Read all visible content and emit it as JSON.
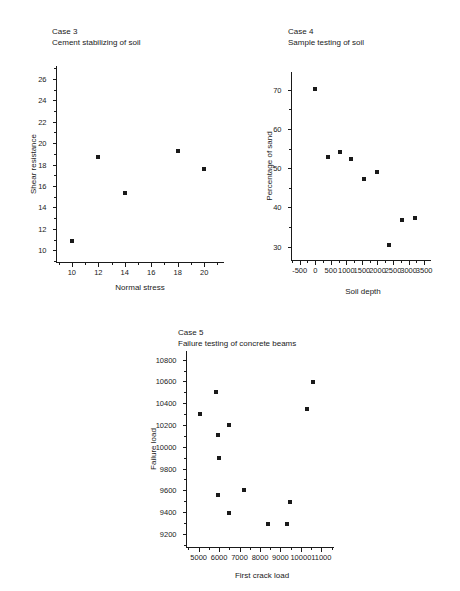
{
  "figure": {
    "background": "#ffffff",
    "marker_color": "#1a1a1a",
    "axis_color": "#1a1a1a"
  },
  "charts": [
    {
      "id": "case-3",
      "type": "scatter",
      "title_line1": "Case 3",
      "title_line2": "Cement stabilizing of soil",
      "title": "Case 3 — Cement stabilizing of soil",
      "xlabel": "Normal stress",
      "ylabel": "Shear resistance",
      "xticks": [
        10,
        12,
        14,
        16,
        18,
        20
      ],
      "yticks": [
        10,
        12,
        14,
        16,
        18,
        20,
        22,
        24,
        26
      ],
      "xlim": [
        8.8,
        21.5
      ],
      "ylim": [
        8.9,
        27.2
      ],
      "grid": false,
      "legend": "none",
      "points": [
        {
          "x": 10,
          "y": 10.9
        },
        {
          "x": 12,
          "y": 18.7
        },
        {
          "x": 14,
          "y": 15.35
        },
        {
          "x": 18,
          "y": 19.25
        },
        {
          "x": 20,
          "y": 17.55
        }
      ]
    },
    {
      "id": "case-4",
      "type": "scatter",
      "title_line1": "Case 4",
      "title_line2": "Sample testing of soil",
      "title": "Case 4 — Sample testing of soil",
      "xlabel": "Soil depth",
      "ylabel": "Percentage of sand",
      "xticks": [
        -500,
        0,
        500,
        1000,
        1500,
        2000,
        2500,
        3000,
        3500
      ],
      "yticks": [
        30,
        40,
        50,
        60,
        70
      ],
      "xlim": [
        -780,
        3720
      ],
      "ylim": [
        26.6,
        74.5
      ],
      "grid": false,
      "legend": "none",
      "points": [
        {
          "x": 0,
          "y": 70.2
        },
        {
          "x": 400,
          "y": 52.9
        },
        {
          "x": 780,
          "y": 54.2
        },
        {
          "x": 1150,
          "y": 52.3
        },
        {
          "x": 1580,
          "y": 47.3
        },
        {
          "x": 2000,
          "y": 49.1
        },
        {
          "x": 2380,
          "y": 30.4
        },
        {
          "x": 2790,
          "y": 36.8
        },
        {
          "x": 3200,
          "y": 37.3
        }
      ]
    },
    {
      "id": "case-5",
      "type": "scatter",
      "title_line1": "Case 5",
      "title_line2": "Failure testing of concrete beams",
      "title": "Case 5 — Failure testing of concrete beams",
      "xlabel": "First crack load",
      "ylabel": "Failure load",
      "xticks": [
        5000,
        6000,
        7000,
        8000,
        9000,
        10000,
        11000
      ],
      "yticks": [
        9200,
        9400,
        9600,
        9800,
        10000,
        10200,
        10400,
        10600,
        10800
      ],
      "xlim": [
        4380,
        11620
      ],
      "ylim": [
        9080,
        10880
      ],
      "grid": false,
      "legend": "none",
      "points": [
        {
          "x": 5080,
          "y": 10300
        },
        {
          "x": 5850,
          "y": 10505
        },
        {
          "x": 5960,
          "y": 10105
        },
        {
          "x": 5980,
          "y": 9895
        },
        {
          "x": 5960,
          "y": 9560
        },
        {
          "x": 6500,
          "y": 10205
        },
        {
          "x": 6500,
          "y": 9395
        },
        {
          "x": 7200,
          "y": 9600
        },
        {
          "x": 8400,
          "y": 9295
        },
        {
          "x": 9330,
          "y": 9295
        },
        {
          "x": 9480,
          "y": 9490
        },
        {
          "x": 10320,
          "y": 10345
        },
        {
          "x": 10580,
          "y": 10595
        }
      ]
    }
  ],
  "chart_data": [
    {
      "type": "scatter",
      "title": "Case 3 — Cement stabilizing of soil",
      "xlabel": "Normal stress",
      "ylabel": "Shear resistance",
      "xlim": [
        8.8,
        21.5
      ],
      "ylim": [
        8.9,
        27.2
      ],
      "xticks": [
        10,
        12,
        14,
        16,
        18,
        20
      ],
      "yticks": [
        10,
        12,
        14,
        16,
        18,
        20,
        22,
        24,
        26
      ],
      "grid": false,
      "legend": "none",
      "x": [
        10,
        12,
        14,
        18,
        20
      ],
      "y": [
        10.9,
        18.7,
        15.35,
        19.25,
        17.55
      ]
    },
    {
      "type": "scatter",
      "title": "Case 4 — Sample testing of soil",
      "xlabel": "Soil depth",
      "ylabel": "Percentage of sand",
      "xlim": [
        -780,
        3720
      ],
      "ylim": [
        26.6,
        74.5
      ],
      "xticks": [
        -500,
        0,
        500,
        1000,
        1500,
        2000,
        2500,
        3000,
        3500
      ],
      "yticks": [
        30,
        40,
        50,
        60,
        70
      ],
      "grid": false,
      "legend": "none",
      "x": [
        0,
        400,
        780,
        1150,
        1580,
        2000,
        2380,
        2790,
        3200
      ],
      "y": [
        70.2,
        52.9,
        54.2,
        52.3,
        47.3,
        49.1,
        30.4,
        36.8,
        37.3
      ]
    },
    {
      "type": "scatter",
      "title": "Case 5 — Failure testing of concrete beams",
      "xlabel": "First crack load",
      "ylabel": "Failure load",
      "xlim": [
        4380,
        11620
      ],
      "ylim": [
        9080,
        10880
      ],
      "xticks": [
        5000,
        6000,
        7000,
        8000,
        9000,
        10000,
        11000
      ],
      "yticks": [
        9200,
        9400,
        9600,
        9800,
        10000,
        10200,
        10400,
        10600,
        10800
      ],
      "grid": false,
      "legend": "none",
      "x": [
        5080,
        5850,
        5960,
        5980,
        5960,
        6500,
        6500,
        7200,
        8400,
        9330,
        9480,
        10320,
        10580
      ],
      "y": [
        10300,
        10505,
        10105,
        9895,
        9560,
        10205,
        9395,
        9600,
        9295,
        9295,
        9490,
        10345,
        10595
      ]
    }
  ]
}
